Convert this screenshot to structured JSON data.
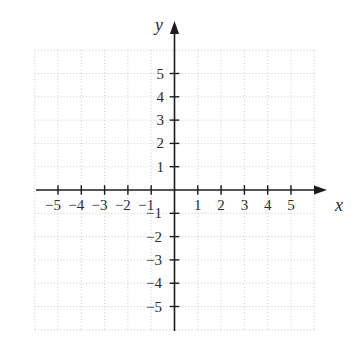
{
  "chart_data": {
    "type": "scatter",
    "series": [],
    "title": "",
    "xlabel": "x",
    "ylabel": "y",
    "xlim": [
      -6,
      6
    ],
    "ylim": [
      -6,
      6
    ],
    "x_ticks": [
      -5,
      -4,
      -3,
      -2,
      -1,
      1,
      2,
      3,
      4,
      5
    ],
    "x_tick_labels": [
      "−5",
      "−4",
      "−3",
      "−2",
      "−1",
      "1",
      "2",
      "3",
      "4",
      "5"
    ],
    "y_ticks": [
      -5,
      -4,
      -3,
      -2,
      -1,
      1,
      2,
      3,
      4,
      5
    ],
    "y_tick_labels": [
      "−5",
      "−4",
      "−3",
      "−2",
      "−1",
      "1",
      "2",
      "3",
      "4",
      "5"
    ],
    "grid": true,
    "grid_style": "dotted",
    "legend": false
  },
  "colors": {
    "background": "#ffffff",
    "axis": "#1c1c1c",
    "tick_label": "#2b2b2b",
    "grid": "#cbcbcb"
  }
}
